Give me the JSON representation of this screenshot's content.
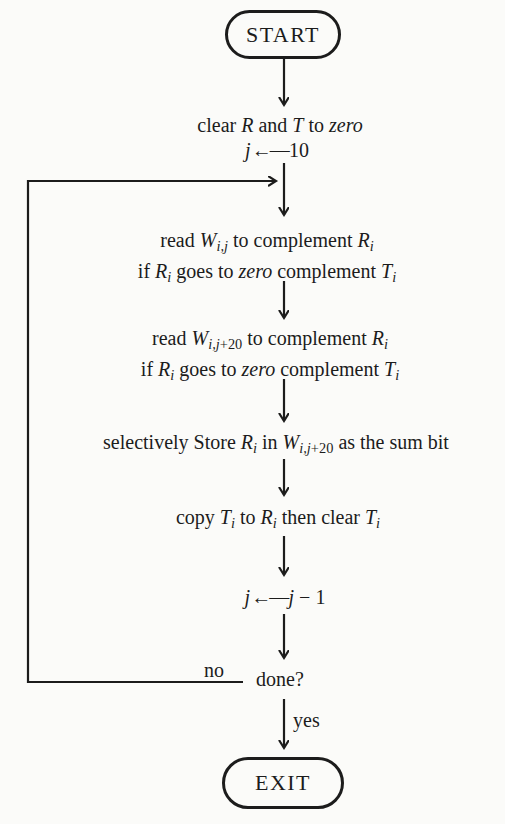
{
  "ink_color": "#1c1c1c",
  "paper_color": "#fbfbf9",
  "terminals": {
    "start": "START",
    "exit": "EXIT"
  },
  "steps": {
    "clear": {
      "lines": [
        [
          {
            "t": "clear "
          },
          {
            "t": "R",
            "s": "i"
          },
          {
            "t": " and "
          },
          {
            "t": "T",
            "s": "i"
          },
          {
            "t": " to "
          },
          {
            "t": "zero",
            "s": "i"
          }
        ]
      ]
    },
    "setj": {
      "lines": [
        [
          {
            "t": "j",
            "s": "i"
          },
          {
            "t": "←—",
            "s": "arrow"
          },
          {
            "t": "10"
          }
        ]
      ]
    },
    "read1": {
      "lines": [
        [
          {
            "t": "read "
          },
          {
            "t": "W",
            "s": "i"
          },
          {
            "t": "i,j",
            "s": "sub"
          },
          {
            "t": " to complement "
          },
          {
            "t": "R",
            "s": "i"
          },
          {
            "t": "i",
            "s": "sub"
          }
        ],
        [
          {
            "t": "if "
          },
          {
            "t": "R",
            "s": "i"
          },
          {
            "t": "i",
            "s": "sub"
          },
          {
            "t": " goes to "
          },
          {
            "t": "zero",
            "s": "i"
          },
          {
            "t": " complement "
          },
          {
            "t": "T",
            "s": "i"
          },
          {
            "t": "i",
            "s": "sub"
          }
        ]
      ]
    },
    "read2": {
      "lines": [
        [
          {
            "t": "read "
          },
          {
            "t": "W",
            "s": "i"
          },
          {
            "t": "i,j",
            "s": "sub"
          },
          {
            "t": "+20",
            "s": "subr"
          },
          {
            "t": " to complement "
          },
          {
            "t": "R",
            "s": "i"
          },
          {
            "t": "i",
            "s": "sub"
          }
        ],
        [
          {
            "t": "if "
          },
          {
            "t": "R",
            "s": "i"
          },
          {
            "t": "i",
            "s": "sub"
          },
          {
            "t": " goes to "
          },
          {
            "t": "zero",
            "s": "i"
          },
          {
            "t": " complement "
          },
          {
            "t": "T",
            "s": "i"
          },
          {
            "t": "i",
            "s": "sub"
          }
        ]
      ]
    },
    "store": {
      "lines": [
        [
          {
            "t": "selectively Store "
          },
          {
            "t": "R",
            "s": "i"
          },
          {
            "t": "i",
            "s": "sub"
          },
          {
            "t": " in "
          },
          {
            "t": "W",
            "s": "i"
          },
          {
            "t": "i,j",
            "s": "sub"
          },
          {
            "t": "+20",
            "s": "subr"
          },
          {
            "t": " as the sum bit"
          }
        ]
      ]
    },
    "copy": {
      "lines": [
        [
          {
            "t": "copy "
          },
          {
            "t": "T",
            "s": "i"
          },
          {
            "t": "i",
            "s": "sub"
          },
          {
            "t": " to "
          },
          {
            "t": "R",
            "s": "i"
          },
          {
            "t": "i",
            "s": "sub"
          },
          {
            "t": " then clear "
          },
          {
            "t": "T",
            "s": "i"
          },
          {
            "t": "i",
            "s": "sub"
          }
        ]
      ]
    },
    "decj": {
      "lines": [
        [
          {
            "t": "j",
            "s": "i"
          },
          {
            "t": "←—",
            "s": "arrow"
          },
          {
            "t": "j",
            "s": "i"
          },
          {
            "t": " − 1"
          }
        ]
      ]
    }
  },
  "decision": {
    "label": "done?",
    "no_label": "no",
    "yes_label": "yes"
  }
}
